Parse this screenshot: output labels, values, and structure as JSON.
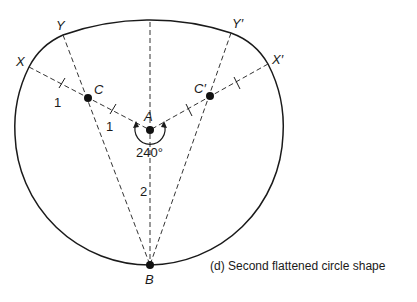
{
  "diagram": {
    "caption": "(d)  Second flattened circle shape",
    "points": {
      "A": "A",
      "B": "B",
      "C": "C",
      "C_prime": "C′",
      "X": "X",
      "X_prime": "X′",
      "Y": "Y",
      "Y_prime": "Y′"
    },
    "measures": {
      "XC": "1",
      "CA": "1",
      "AB": "2",
      "angle": "240°"
    },
    "colors": {
      "stroke": "#1a1a1a",
      "background": "#ffffff"
    }
  }
}
